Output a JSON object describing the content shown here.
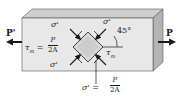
{
  "diagram": {
    "type": "stress-element-under-axial-load",
    "colors": {
      "bar_front": "#e6e6e6",
      "bar_top": "#c8c8c8",
      "bar_side": "#b0b0b0",
      "element_fill": "#d4d4d4",
      "arrow": "#1a1a1a"
    },
    "loads": {
      "left": "P'",
      "right": "P"
    },
    "labels": {
      "sigma_top_left": "σ'",
      "sigma_top_right": "σ'",
      "sigma_bottom_left": "σ'",
      "sigma_bottom": "σ'",
      "tau_m_right": "τ",
      "tau_m_right_sub": "m",
      "angle": "45°"
    },
    "equations": {
      "tau_left": {
        "lhs": "τ",
        "lhs_sub": "m",
        "eq": "=",
        "numerator": "P",
        "denominator": "2A"
      },
      "sigma_bottom": {
        "lhs": "σ'",
        "eq": "=",
        "numerator": "P",
        "denominator": "2A"
      }
    }
  }
}
